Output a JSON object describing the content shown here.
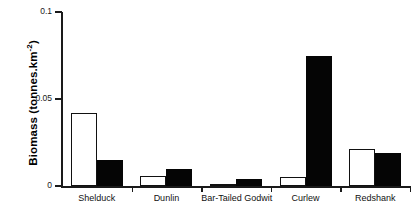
{
  "chart_data": {
    "type": "bar",
    "title": "",
    "xlabel": "",
    "ylabel": "Biomass (tonnes.km-2)",
    "ylabel_base": "Biomass (tonnes.km",
    "ylabel_sup": "-2",
    "ylabel_tail": ")",
    "categories": [
      "Shelduck",
      "Dunlin",
      "Bar-Tailed Godwit",
      "Curlew",
      "Redshank"
    ],
    "series": [
      {
        "name": "white",
        "color": "#ffffff",
        "edge": "#111111",
        "values": [
          0.042,
          0.006,
          0.001,
          0.005,
          0.021
        ]
      },
      {
        "name": "black",
        "color": "#050505",
        "edge": "#050505",
        "values": [
          0.015,
          0.01,
          0.004,
          0.075,
          0.019
        ]
      }
    ],
    "ylim": [
      0,
      0.1
    ],
    "yticks": [
      0,
      0.05,
      0.1
    ],
    "ytick_labels": [
      "0",
      "0.05",
      "0.1"
    ],
    "grid": false,
    "legend": "none"
  }
}
